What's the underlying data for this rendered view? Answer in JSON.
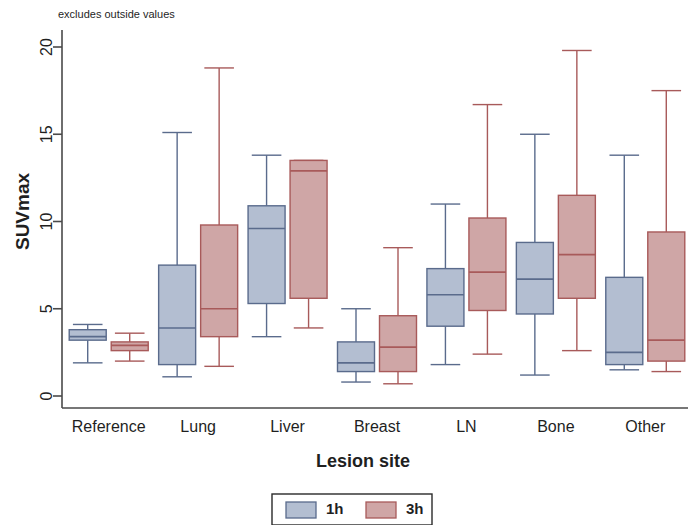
{
  "note": "excludes outside values",
  "axes": {
    "ylabel": "SUVmax",
    "xlabel": "Lesion site",
    "yticks": [
      "0",
      "5",
      "10",
      "15",
      "20"
    ],
    "ylim": [
      0,
      21.5
    ],
    "xticks": [
      "Reference",
      "Lung",
      "Liver",
      "Breast",
      "LN",
      "Bone",
      "Other"
    ]
  },
  "legend": {
    "items": [
      {
        "label": "1h",
        "color": "#b3bed1"
      },
      {
        "label": "3h",
        "color": "#cfa6a6"
      }
    ]
  },
  "colors": {
    "series_1h_fill": "#b3bed1",
    "series_1h_stroke": "#5a6b8c",
    "series_3h_fill": "#cfa6a6",
    "series_3h_stroke": "#a85a5a",
    "axis": "#4a4a4a",
    "background": "#ffffff"
  },
  "chart_data": {
    "type": "box",
    "title": "",
    "subtitle": "excludes outside values",
    "xlabel": "Lesion site",
    "ylabel": "SUVmax",
    "ylim": [
      0,
      21.5
    ],
    "yticks": [
      0,
      5,
      10,
      15,
      20
    ],
    "grid": false,
    "legend_position": "bottom",
    "categories": [
      "Reference",
      "Lung",
      "Liver",
      "Breast",
      "LN",
      "Bone",
      "Other"
    ],
    "series": [
      {
        "name": "1h",
        "color": "#b3bed1",
        "boxes": [
          {
            "category": "Reference",
            "whisker_low": 1.9,
            "q1": 3.2,
            "median": 3.4,
            "q3": 3.8,
            "whisker_high": 4.1
          },
          {
            "category": "Lung",
            "whisker_low": 1.1,
            "q1": 1.8,
            "median": 3.9,
            "q3": 7.5,
            "whisker_high": 15.1
          },
          {
            "category": "Liver",
            "whisker_low": 3.4,
            "q1": 5.3,
            "median": 9.6,
            "q3": 10.9,
            "whisker_high": 13.8
          },
          {
            "category": "Breast",
            "whisker_low": 0.8,
            "q1": 1.4,
            "median": 1.9,
            "q3": 3.1,
            "whisker_high": 5.0
          },
          {
            "category": "LN",
            "whisker_low": 1.8,
            "q1": 4.0,
            "median": 5.8,
            "q3": 7.3,
            "whisker_high": 11.0
          },
          {
            "category": "Bone",
            "whisker_low": 1.2,
            "q1": 4.7,
            "median": 6.7,
            "q3": 8.8,
            "whisker_high": 15.0
          },
          {
            "category": "Other",
            "whisker_low": 1.5,
            "q1": 1.8,
            "median": 2.5,
            "q3": 6.8,
            "whisker_high": 13.8
          }
        ]
      },
      {
        "name": "3h",
        "color": "#cfa6a6",
        "boxes": [
          {
            "category": "Reference",
            "whisker_low": 2.0,
            "q1": 2.6,
            "median": 2.9,
            "q3": 3.1,
            "whisker_high": 3.6
          },
          {
            "category": "Lung",
            "whisker_low": 1.7,
            "q1": 3.4,
            "median": 5.0,
            "q3": 9.8,
            "whisker_high": 18.8
          },
          {
            "category": "Liver",
            "whisker_low": 3.9,
            "q1": 5.6,
            "median": 12.9,
            "q3": 13.5,
            "whisker_high": 13.5
          },
          {
            "category": "Breast",
            "whisker_low": 0.7,
            "q1": 1.4,
            "median": 2.8,
            "q3": 4.6,
            "whisker_high": 8.5
          },
          {
            "category": "LN",
            "whisker_low": 2.4,
            "q1": 4.9,
            "median": 7.1,
            "q3": 10.2,
            "whisker_high": 16.7
          },
          {
            "category": "Bone",
            "whisker_low": 2.6,
            "q1": 5.6,
            "median": 8.1,
            "q3": 11.5,
            "whisker_high": 19.8
          },
          {
            "category": "Other",
            "whisker_low": 1.4,
            "q1": 2.0,
            "median": 3.2,
            "q3": 9.4,
            "whisker_high": 17.5
          }
        ]
      }
    ]
  }
}
